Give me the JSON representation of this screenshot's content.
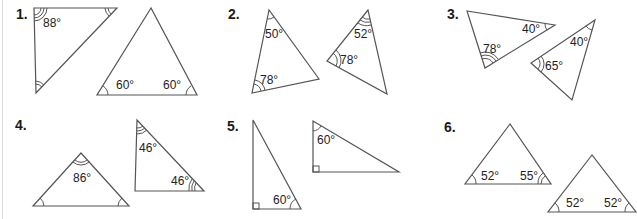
{
  "questions": [
    {
      "number": "1.",
      "triangles": [
        {
          "points": [
            [
              34,
              8
            ],
            [
              117,
              8
            ],
            [
              36,
              93
            ]
          ],
          "labels": [
            {
              "text": "88°",
              "x": 43,
              "y": 27
            }
          ]
        },
        {
          "points": [
            [
              151,
              8
            ],
            [
              97,
              95
            ],
            [
              197,
              95
            ]
          ],
          "labels": [
            {
              "text": "60°",
              "x": 116,
              "y": 89
            },
            {
              "text": "60°",
              "x": 163,
              "y": 89
            }
          ]
        }
      ]
    },
    {
      "number": "2.",
      "triangles": [
        {
          "points": [
            [
              269,
              10
            ],
            [
              252,
              93
            ],
            [
              319,
              79
            ]
          ],
          "labels": [
            {
              "text": "50°",
              "x": 265,
              "y": 38
            },
            {
              "text": "78°",
              "x": 260,
              "y": 84
            }
          ]
        },
        {
          "points": [
            [
              368,
              10
            ],
            [
              327,
              61
            ],
            [
              387,
              94
            ]
          ],
          "labels": [
            {
              "text": "52°",
              "x": 354,
              "y": 38
            },
            {
              "text": "78°",
              "x": 340,
              "y": 64
            }
          ]
        }
      ]
    },
    {
      "number": "3.",
      "triangles": [
        {
          "points": [
            [
              467,
              11
            ],
            [
              555,
              25
            ],
            [
              485,
              68
            ]
          ],
          "labels": [
            {
              "text": "40°",
              "x": 522,
              "y": 33
            },
            {
              "text": "78°",
              "x": 483,
              "y": 53
            }
          ]
        },
        {
          "points": [
            [
              595,
              20
            ],
            [
              531,
              63
            ],
            [
              572,
              100
            ]
          ],
          "labels": [
            {
              "text": "40°",
              "x": 570,
              "y": 46
            },
            {
              "text": "65°",
              "x": 545,
              "y": 70
            }
          ]
        }
      ]
    },
    {
      "number": "4.",
      "triangles": [
        {
          "points": [
            [
              81,
              153
            ],
            [
              33,
              206
            ],
            [
              129,
              206
            ]
          ],
          "labels": [
            {
              "text": "86°",
              "x": 73,
              "y": 182
            }
          ]
        },
        {
          "points": [
            [
              137,
              120
            ],
            [
              135,
              191
            ],
            [
              204,
              191
            ]
          ],
          "labels": [
            {
              "text": "46°",
              "x": 139,
              "y": 152
            },
            {
              "text": "46°",
              "x": 171,
              "y": 185
            }
          ]
        }
      ]
    },
    {
      "number": "5.",
      "triangles": [
        {
          "points": [
            [
              253,
              120
            ],
            [
              253,
              209
            ],
            [
              301,
              209
            ]
          ],
          "labels": [
            {
              "text": "60°",
              "x": 273,
              "y": 204
            }
          ],
          "right_angle": [
            253,
            209,
            "bl"
          ]
        },
        {
          "points": [
            [
              313,
              121
            ],
            [
              313,
              172
            ],
            [
              399,
              172
            ]
          ],
          "labels": [
            {
              "text": "60°",
              "x": 317,
              "y": 144
            }
          ],
          "right_angle": [
            313,
            172,
            "bl"
          ]
        }
      ]
    },
    {
      "number": "6.",
      "triangles": [
        {
          "points": [
            [
              510,
              124
            ],
            [
              465,
              184
            ],
            [
              551,
              184
            ]
          ],
          "labels": [
            {
              "text": "52°",
              "x": 481,
              "y": 180
            },
            {
              "text": "55°",
              "x": 520,
              "y": 180
            }
          ]
        },
        {
          "points": [
            [
              592,
              155
            ],
            [
              548,
              212
            ],
            [
              636,
              212
            ]
          ],
          "labels": [
            {
              "text": "52°",
              "x": 566,
              "y": 207
            },
            {
              "text": "52°",
              "x": 604,
              "y": 207
            }
          ]
        }
      ]
    }
  ],
  "label_positions": [
    [
      16,
      19
    ],
    [
      228,
      19
    ],
    [
      447,
      19
    ],
    [
      15,
      130
    ],
    [
      227,
      131
    ],
    [
      444,
      132
    ]
  ]
}
